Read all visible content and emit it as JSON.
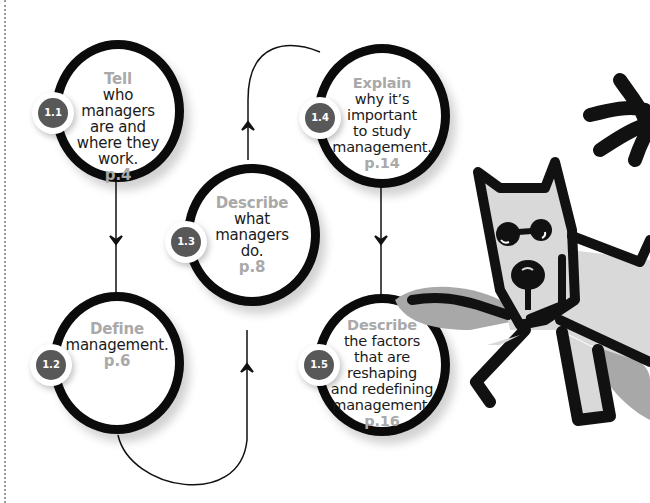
{
  "diagram": {
    "type": "learning-objectives-flow",
    "colors": {
      "circle_stroke": "#0b0b0b",
      "badge_fill": "#585858",
      "verb_text": "#a9a9a9",
      "body_text": "#1a1a1a",
      "dog_fill": "#d9d9d9",
      "dog_shadow": "#a8a8a8"
    },
    "objectives": [
      {
        "id": "1.1",
        "verb": "Tell",
        "lines": [
          "who",
          "managers",
          "are and",
          "where they",
          "work."
        ],
        "page": "p.4"
      },
      {
        "id": "1.2",
        "verb": "Define",
        "lines": [
          "management."
        ],
        "page": "p.6"
      },
      {
        "id": "1.3",
        "verb": "Describe",
        "lines": [
          "what",
          "managers",
          "do."
        ],
        "page": "p.8"
      },
      {
        "id": "1.4",
        "verb": "Explain",
        "lines": [
          "why it’s",
          "important",
          "to study",
          "management."
        ],
        "page": "p.14"
      },
      {
        "id": "1.5",
        "verb": "Describe",
        "lines": [
          "the factors",
          "that are",
          "reshaping",
          "and redefining",
          "management."
        ],
        "page": "p.16"
      }
    ],
    "flow_order": [
      "1.1",
      "1.2",
      "1.3",
      "1.4",
      "1.5"
    ],
    "illustration": "cartoon-dog"
  }
}
